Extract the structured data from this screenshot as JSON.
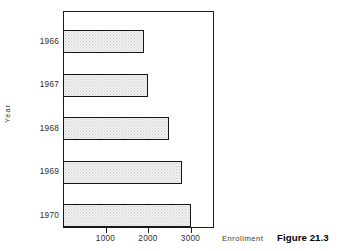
{
  "caption": "Figure 21.3",
  "axis_titles": {
    "x": "Enrollment",
    "y": "Year"
  },
  "xticks": [
    {
      "label": "1000",
      "value": 1000
    },
    {
      "label": "2000",
      "value": 2000
    },
    {
      "label": "3000",
      "value": 3000
    }
  ],
  "bars": [
    {
      "category": "1966",
      "value": 1900
    },
    {
      "category": "1967",
      "value": 2000
    },
    {
      "category": "1968",
      "value": 2500
    },
    {
      "category": "1969",
      "value": 2800
    },
    {
      "category": "1970",
      "value": 3000
    }
  ],
  "chart_data": {
    "type": "bar",
    "orientation": "horizontal",
    "title": "",
    "subtitle": "",
    "categories": [
      "1966",
      "1967",
      "1968",
      "1969",
      "1970"
    ],
    "values": [
      1900,
      2000,
      2500,
      2800,
      3000
    ],
    "xlabel": "Enrollment",
    "ylabel": "Year",
    "xlim": [
      0,
      3550
    ],
    "xtick_labels": [
      "1000",
      "2000",
      "3000"
    ],
    "xtick_values": [
      1000,
      2000,
      3000
    ],
    "ytick_labels": [
      "1966",
      "1967",
      "1968",
      "1969",
      "1970"
    ],
    "grid": false,
    "legend": false,
    "bar_fill": "#f2f2f2",
    "bar_edge": "#151515",
    "caption": "Figure 21.3"
  }
}
